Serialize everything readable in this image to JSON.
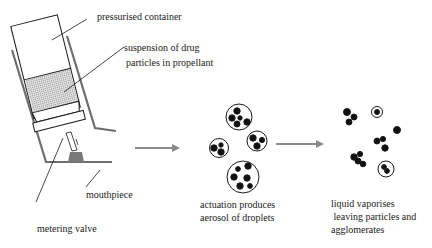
{
  "diagram": {
    "device_labels": {
      "container": "pressurised container",
      "suspension_line1": "suspension of drug",
      "suspension_line2": "particles in propellant",
      "mouthpiece": "mouthpiece",
      "valve": "metering valve"
    },
    "stage2": {
      "caption_line1": "actuation produces",
      "caption_line2": "aerosol of droplets"
    },
    "stage3": {
      "caption_line1": "liquid vaporises",
      "caption_line2": " leaving particles and",
      "caption_line3": "agglomerates"
    },
    "colors": {
      "outline": "#1a1a1a",
      "housing": "#6e6e6e",
      "arrow": "#8a8a8a",
      "suspension_fill": "#c8c8c8",
      "particle": "#111111"
    }
  }
}
